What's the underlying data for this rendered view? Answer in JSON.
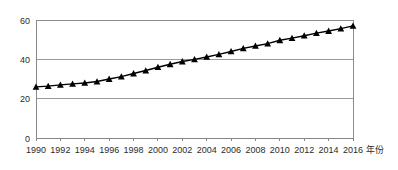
{
  "chart_data": {
    "type": "line",
    "title": "",
    "subtitle": "",
    "xlabel": "年份",
    "ylabel": "",
    "grid": true,
    "legend": false,
    "legend_position": "none",
    "xlim": [
      1990,
      2016
    ],
    "ylim": [
      0,
      60
    ],
    "y_ticks": [
      0,
      20,
      40,
      60
    ],
    "x_ticks": [
      1990,
      1992,
      1994,
      1996,
      1998,
      2000,
      2002,
      2004,
      2006,
      2008,
      2010,
      2012,
      2014,
      2016
    ],
    "x_tick_labels": [
      "1990",
      "1992",
      "1994",
      "1996",
      "1998",
      "2000",
      "2002",
      "2004",
      "2006",
      "2008",
      "2010",
      "2012",
      "2014",
      "2016"
    ],
    "y_tick_labels": [
      "0",
      "20",
      "40",
      "60"
    ],
    "marker": "triangle-up",
    "marker_color": "#000000",
    "line_color": "#000000",
    "x": [
      1990,
      1991,
      1992,
      1993,
      1994,
      1995,
      1996,
      1997,
      1998,
      1999,
      2000,
      2001,
      2002,
      2003,
      2004,
      2005,
      2006,
      2007,
      2008,
      2009,
      2010,
      2011,
      2012,
      2013,
      2014,
      2015,
      2016
    ],
    "values": [
      26.0,
      26.4,
      27.0,
      27.5,
      28.0,
      28.7,
      30.0,
      31.2,
      32.8,
      34.3,
      36.0,
      37.5,
      38.9,
      40.0,
      41.2,
      42.5,
      44.0,
      45.6,
      46.8,
      48.0,
      49.7,
      50.8,
      52.0,
      53.3,
      54.4,
      55.6,
      57.0
    ],
    "series": [
      {
        "name": "series-1",
        "values": [
          26.0,
          26.4,
          27.0,
          27.5,
          28.0,
          28.7,
          30.0,
          31.2,
          32.8,
          34.3,
          36.0,
          37.5,
          38.9,
          40.0,
          41.2,
          42.5,
          44.0,
          45.6,
          46.8,
          48.0,
          49.7,
          50.8,
          52.0,
          53.3,
          54.4,
          55.6,
          57.0
        ]
      }
    ]
  },
  "colors": {
    "grid": "#9a9a9a",
    "axis": "#888888",
    "plot_border": "#8c8c8c",
    "series": "#000000",
    "text": "#2b2b2b",
    "background": "#ffffff"
  }
}
